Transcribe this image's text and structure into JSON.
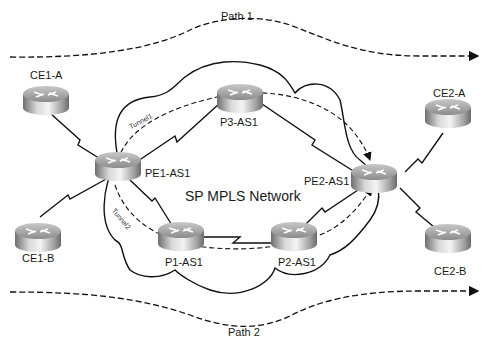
{
  "diagram": {
    "title": "SP MPLS Network",
    "paths": [
      {
        "id": "path1",
        "label": "Path 1"
      },
      {
        "id": "path2",
        "label": "Path 2"
      }
    ],
    "tunnels": [
      {
        "id": "tunnel1",
        "label": "Tunnel1",
        "route": [
          "PE1-AS1",
          "P3-AS1",
          "PE2-AS1"
        ]
      },
      {
        "id": "tunnel2",
        "label": "Tunnel2",
        "route": [
          "PE1-AS1",
          "P1-AS1",
          "P2-AS1",
          "PE2-AS1"
        ]
      }
    ],
    "routers": [
      {
        "id": "ce1a",
        "label": "CE1-A"
      },
      {
        "id": "ce1b",
        "label": "CE1-B"
      },
      {
        "id": "pe1",
        "label": "PE1-AS1"
      },
      {
        "id": "p3",
        "label": "P3-AS1"
      },
      {
        "id": "p1",
        "label": "P1-AS1"
      },
      {
        "id": "p2",
        "label": "P2-AS1"
      },
      {
        "id": "pe2",
        "label": "PE2-AS1"
      },
      {
        "id": "ce2a",
        "label": "CE2-A"
      },
      {
        "id": "ce2b",
        "label": "CE2-B"
      }
    ],
    "links": [
      [
        "CE1-A",
        "PE1-AS1"
      ],
      [
        "CE1-B",
        "PE1-AS1"
      ],
      [
        "PE1-AS1",
        "P3-AS1"
      ],
      [
        "PE1-AS1",
        "P1-AS1"
      ],
      [
        "P3-AS1",
        "PE2-AS1"
      ],
      [
        "P1-AS1",
        "P2-AS1"
      ],
      [
        "P2-AS1",
        "PE2-AS1"
      ],
      [
        "PE2-AS1",
        "CE2-A"
      ],
      [
        "PE2-AS1",
        "CE2-B"
      ]
    ],
    "colors": {
      "line": "#111111",
      "background": "#ffffff",
      "router_body": "#9a9a9a"
    }
  }
}
